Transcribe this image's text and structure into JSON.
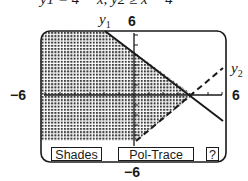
{
  "header": {
    "equations_text": "y1 = 4 − x,  y2 ≥ x − 4"
  },
  "graph": {
    "x_min_label": "−6",
    "x_max_label": "6",
    "y_max_label": "6",
    "y_min_label": "−6",
    "curves": [
      {
        "name": "y1",
        "label_main": "y",
        "label_sub": "1",
        "style": "solid",
        "equation": "y = 4 − x"
      },
      {
        "name": "y2",
        "label_main": "y",
        "label_sub": "2",
        "style": "dashed",
        "equation": "y = x − 4"
      }
    ],
    "intersection": {
      "x": 4,
      "y": 0
    },
    "shading": "dotted"
  },
  "menu": {
    "shades_label": "Shades",
    "pol_trace_label": "Pol-Trace",
    "help_label": "?"
  },
  "colors": {
    "ink": "#1a1a1a",
    "background": "#ffffff"
  }
}
